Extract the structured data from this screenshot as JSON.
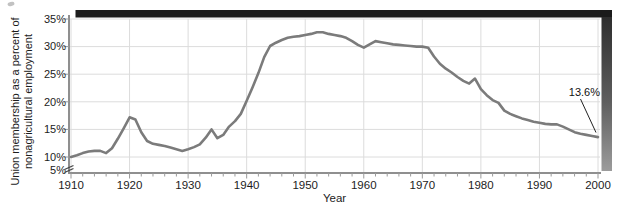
{
  "colors": {
    "line": "#7b7b7b",
    "grid": "#dcdcdc",
    "axis": "#8f8f8f",
    "tick": "#9a9a9a",
    "text": "#1c1c1c",
    "top_bar": "#1b1b1b",
    "right_bar_top": "#2e2e2e",
    "right_bar_bottom": "#9c9c9c",
    "annotation_line": "#222222"
  },
  "chart_data": {
    "type": "line",
    "title": "",
    "xlabel": "Year",
    "ylabel": "Union membership as a percent of nonagricultural employment",
    "ylabel_line1": "Union membership as a percent of",
    "ylabel_line2": "nonagricultural employment",
    "xlim": [
      1910,
      2000
    ],
    "ylim": [
      5,
      35
    ],
    "axis_break_below": 10,
    "grid": true,
    "legend": "none",
    "x_tick_labels": [
      "1910",
      "1920",
      "1930",
      "1940",
      "1950",
      "1960",
      "1970",
      "1980",
      "1990",
      "2000"
    ],
    "x_tick_values": [
      1910,
      1920,
      1930,
      1940,
      1950,
      1960,
      1970,
      1980,
      1990,
      2000
    ],
    "x_minor_tick_step_years": 2,
    "y_tick_labels": [
      "35%",
      "30%",
      "25%",
      "20%",
      "15%",
      "10%",
      "5%"
    ],
    "y_tick_values": [
      35,
      30,
      25,
      20,
      15,
      10,
      5
    ],
    "annotation": {
      "text": "13.6%",
      "x": 2000,
      "y": 13.6
    },
    "series": [
      {
        "name": "Union membership as a percent of nonagricultural employment",
        "x": [
          1910,
          1911,
          1912,
          1913,
          1914,
          1915,
          1916,
          1917,
          1918,
          1919,
          1920,
          1921,
          1922,
          1923,
          1924,
          1925,
          1926,
          1927,
          1928,
          1929,
          1930,
          1931,
          1932,
          1933,
          1934,
          1935,
          1936,
          1937,
          1938,
          1939,
          1940,
          1941,
          1942,
          1943,
          1944,
          1945,
          1946,
          1947,
          1948,
          1949,
          1950,
          1951,
          1952,
          1953,
          1954,
          1955,
          1956,
          1957,
          1958,
          1959,
          1960,
          1961,
          1962,
          1963,
          1964,
          1965,
          1966,
          1967,
          1968,
          1969,
          1970,
          1971,
          1972,
          1973,
          1974,
          1975,
          1976,
          1977,
          1978,
          1979,
          1980,
          1981,
          1982,
          1983,
          1984,
          1985,
          1986,
          1987,
          1988,
          1989,
          1990,
          1991,
          1992,
          1993,
          1994,
          1995,
          1996,
          1997,
          1998,
          1999,
          2000
        ],
        "y": [
          10.0,
          10.3,
          10.7,
          11.0,
          11.1,
          11.1,
          10.7,
          11.6,
          13.3,
          15.2,
          17.2,
          16.8,
          14.5,
          12.9,
          12.4,
          12.2,
          12.0,
          11.7,
          11.4,
          11.1,
          11.4,
          11.8,
          12.3,
          13.5,
          15.0,
          13.4,
          14.0,
          15.5,
          16.5,
          17.8,
          20.2,
          22.6,
          25.2,
          28.1,
          30.1,
          30.7,
          31.2,
          31.6,
          31.8,
          31.9,
          32.1,
          32.3,
          32.6,
          32.6,
          32.3,
          32.1,
          31.9,
          31.6,
          31.0,
          30.3,
          29.8,
          30.4,
          31.0,
          30.8,
          30.6,
          30.4,
          30.3,
          30.2,
          30.1,
          30.0,
          30.0,
          29.8,
          28.2,
          26.9,
          26.0,
          25.3,
          24.5,
          23.8,
          23.3,
          24.2,
          22.3,
          21.2,
          20.3,
          19.8,
          18.4,
          17.8,
          17.4,
          17.0,
          16.7,
          16.4,
          16.2,
          16.0,
          15.9,
          15.9,
          15.5,
          15.0,
          14.5,
          14.2,
          14.0,
          13.8,
          13.6
        ]
      }
    ]
  }
}
